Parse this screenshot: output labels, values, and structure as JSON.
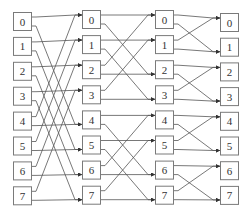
{
  "diagram": {
    "type": "butterfly-network",
    "colors": {
      "box_stroke": "#7a7a7a",
      "wire": "#555555",
      "label": "#333333",
      "background": "#ffffff"
    },
    "columns": [
      {
        "id": "stage-0",
        "x": 13,
        "y0": 12,
        "pitch": 24.9,
        "labels": [
          "0",
          "1",
          "2",
          "3",
          "4",
          "5",
          "6",
          "7"
        ]
      },
      {
        "id": "stage-1",
        "x": 82,
        "y0": 10,
        "pitch": 25.1,
        "labels": [
          "0",
          "1",
          "2",
          "3",
          "4",
          "5",
          "6",
          "7"
        ]
      },
      {
        "id": "stage-2",
        "x": 155,
        "y0": 10,
        "pitch": 25.1,
        "labels": [
          "0",
          "1",
          "2",
          "3",
          "4",
          "5",
          "6",
          "7"
        ]
      },
      {
        "id": "stage-3",
        "x": 220,
        "y0": 13,
        "pitch": 24.7,
        "labels": [
          "0",
          "1",
          "2",
          "3",
          "4",
          "5",
          "6",
          "7"
        ]
      }
    ],
    "box": {
      "width": 18,
      "height": 18
    },
    "stages": [
      {
        "from": 0,
        "to": 1,
        "stride": 4
      },
      {
        "from": 1,
        "to": 2,
        "stride": 2
      },
      {
        "from": 2,
        "to": 3,
        "stride": 1
      }
    ]
  }
}
